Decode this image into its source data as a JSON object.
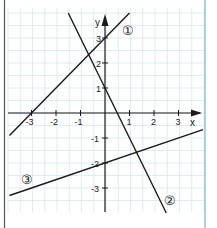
{
  "chart_data": {
    "type": "line",
    "title": "",
    "xlabel": "x",
    "ylabel": "y",
    "xlim": [
      -4,
      4
    ],
    "ylim": [
      -4,
      4
    ],
    "grid": true,
    "x_ticks": [
      -3,
      -2,
      -1,
      1,
      2,
      3
    ],
    "y_ticks": [
      -3,
      -2,
      -1,
      1,
      2,
      3
    ],
    "x_tick_labels": [
      "-3",
      "-2",
      "-1",
      "1",
      "2",
      "3"
    ],
    "y_tick_labels": [
      "-3",
      "-2",
      "-1",
      "1",
      "2",
      "3"
    ],
    "series": [
      {
        "name": "①",
        "equation": "y = x + 3",
        "slope": 1,
        "intercept": 3,
        "x_range": [
          -3.9,
          1.0
        ]
      },
      {
        "name": "②",
        "equation": "y = -2x + 1",
        "slope": -2,
        "intercept": 1,
        "x_range": [
          -1.5,
          2.5
        ]
      },
      {
        "name": "③",
        "equation": "y = x/3 - 2",
        "slope": 0.3333,
        "intercept": -2,
        "x_range": [
          -3.9,
          4.0
        ]
      }
    ],
    "annotations": [
      {
        "text": "①",
        "x": 1.0,
        "y": 3.4
      },
      {
        "text": "②",
        "x": 2.7,
        "y": -3.5
      },
      {
        "text": "③",
        "x": -3.1,
        "y": -2.7
      }
    ]
  },
  "labels": {
    "x_axis": "x",
    "y_axis": "y",
    "line1": "①",
    "line2": "②",
    "line3": "③",
    "xt": [
      "-3",
      "-2",
      "-1",
      "1",
      "2",
      "3"
    ],
    "yt": [
      "3",
      "2",
      "1",
      "-1",
      "-2",
      "-3"
    ]
  },
  "colors": {
    "grid": "#d6e8f2",
    "axis": "#1a1a1a",
    "line": "#1a1a1a",
    "left_border": "#555555",
    "right_border": "#8cc4dc"
  }
}
